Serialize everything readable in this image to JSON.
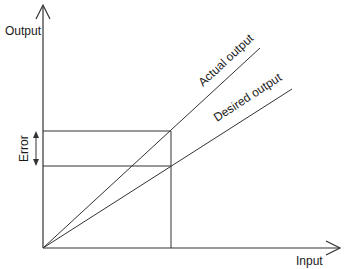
{
  "diagram": {
    "axes": {
      "y_label": "Output",
      "x_label": "Input"
    },
    "lines": {
      "actual": {
        "label": "Actual output"
      },
      "desired": {
        "label": "Desired output"
      }
    },
    "annotation": {
      "error_label": "Error"
    },
    "colors": {
      "stroke": "#333333",
      "background": "#ffffff"
    }
  }
}
